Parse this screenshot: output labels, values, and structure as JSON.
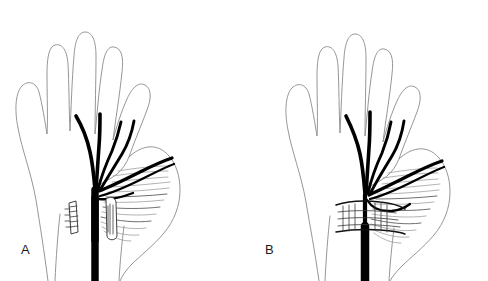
{
  "figure": {
    "type": "anatomical-line-drawing",
    "background_color": "#ffffff",
    "nerve_color": "#000000",
    "outline_color": "#8a8a8a",
    "muscle_color": "#9a9a9a",
    "width": 488,
    "height": 281
  },
  "panels": [
    {
      "id": "A",
      "label": "A",
      "hand": "left-palm-view",
      "condition": "transverse carpal ligament released (divided)",
      "ligament_state": "cut",
      "ligament_pieces": 2,
      "nerve_branches": 4,
      "has_recurrent_motor_branch": true,
      "thenar_muscle_shown": true
    },
    {
      "id": "B",
      "label": "B",
      "hand": "left-palm-view",
      "condition": "transverse carpal ligament intact, compressing the nerve",
      "ligament_state": "intact",
      "ligament_pieces": 1,
      "nerve_branches": 4,
      "has_recurrent_motor_branch": true,
      "thenar_muscle_shown": true
    }
  ]
}
